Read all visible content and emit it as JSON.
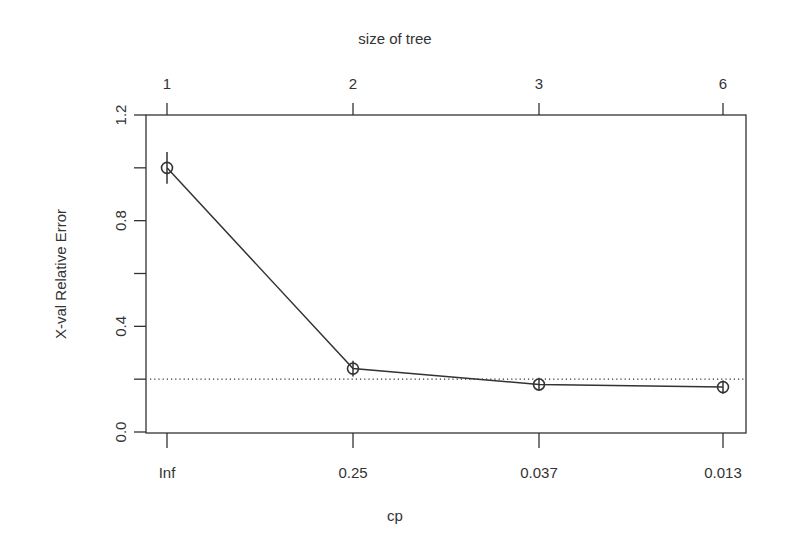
{
  "chart_data": {
    "type": "line",
    "title": "",
    "top_axis_title": "size of tree",
    "xlabel": "cp",
    "ylabel": "X-val Relative Error",
    "categories": [
      "Inf",
      "0.25",
      "0.037",
      "0.013"
    ],
    "top_categories": [
      "1",
      "2",
      "3",
      "6"
    ],
    "series": [
      {
        "name": "xerror",
        "values": [
          1.0,
          0.24,
          0.18,
          0.17
        ],
        "error_bars": [
          0.06,
          0.03,
          0.025,
          0.025
        ]
      }
    ],
    "reference_line": {
      "y": 0.2,
      "style": "dotted"
    },
    "ylim": [
      0.0,
      1.2
    ],
    "yticks": [
      0.0,
      0.2,
      0.4,
      0.6,
      0.8,
      1.0,
      1.2
    ],
    "ytick_labels": [
      "0.0",
      "",
      "0.4",
      "",
      "0.8",
      "",
      "1.2"
    ],
    "grid": false,
    "legend": "none"
  },
  "colors": {
    "line": "#333333",
    "axis": "#333333",
    "background": "#ffffff"
  }
}
